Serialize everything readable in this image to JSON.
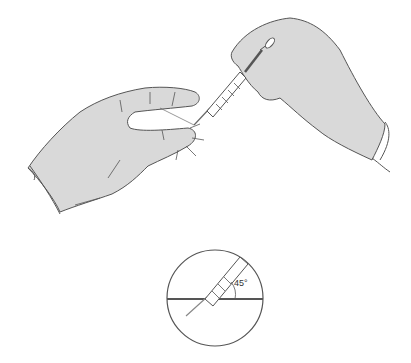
{
  "illustration": {
    "subject": "Gloved hands holding a syringe, one hand pinching skin",
    "inset": {
      "angle_label": "45°",
      "description": "Needle inserted at 45 degree angle to skin surface"
    }
  },
  "colors": {
    "glove_fill": "#d9d9d9",
    "outline": "#555555",
    "background": "#ffffff"
  }
}
